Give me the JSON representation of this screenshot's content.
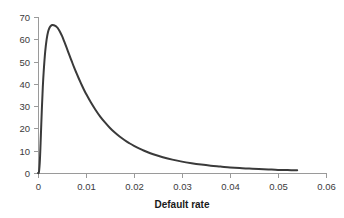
{
  "chart_data": {
    "type": "line",
    "title": "",
    "subtitle": "",
    "xlabel": "Default rate",
    "ylabel": "",
    "xlim": [
      0,
      0.06
    ],
    "ylim": [
      0,
      70
    ],
    "grid": false,
    "legend": null,
    "legend_position": "none",
    "series_color": "#3a3a3a",
    "axis_color": "#9a9a9a",
    "x_ticks": [
      "0",
      "0.01",
      "0.02",
      "0.03",
      "0.04",
      "0.05",
      "0.06"
    ],
    "x_tick_values": [
      0,
      0.01,
      0.02,
      0.03,
      0.04,
      0.05,
      0.06
    ],
    "y_ticks": [
      "0",
      "10",
      "20",
      "30",
      "40",
      "50",
      "60",
      "70"
    ],
    "y_tick_values": [
      0,
      10,
      20,
      30,
      40,
      50,
      60,
      70
    ],
    "series": [
      {
        "name": "density",
        "x": [
          0.0,
          0.0002,
          0.0004,
          0.0006,
          0.0008,
          0.001,
          0.0012,
          0.0015,
          0.0018,
          0.0021,
          0.0024,
          0.0027,
          0.003,
          0.0033,
          0.0036,
          0.0038,
          0.004,
          0.0043,
          0.0046,
          0.005,
          0.0055,
          0.006,
          0.0065,
          0.007,
          0.0075,
          0.008,
          0.0085,
          0.009,
          0.0095,
          0.01,
          0.011,
          0.012,
          0.013,
          0.014,
          0.015,
          0.016,
          0.017,
          0.018,
          0.019,
          0.02,
          0.022,
          0.024,
          0.026,
          0.028,
          0.03,
          0.032,
          0.034,
          0.036,
          0.038,
          0.04,
          0.042,
          0.044,
          0.046,
          0.048,
          0.05,
          0.052,
          0.054
        ],
        "y": [
          0.0,
          0.5,
          6.0,
          17.0,
          28.5,
          38.5,
          46.0,
          54.5,
          60.0,
          63.4,
          65.2,
          66.1,
          66.4,
          66.3,
          66.0,
          65.7,
          65.3,
          64.4,
          63.3,
          61.5,
          58.8,
          56.0,
          53.1,
          50.3,
          47.5,
          44.9,
          42.4,
          40.0,
          37.7,
          35.6,
          31.7,
          28.3,
          25.2,
          22.6,
          20.2,
          18.2,
          16.4,
          14.8,
          13.4,
          12.2,
          10.1,
          8.4,
          7.1,
          6.0,
          5.1,
          4.4,
          3.8,
          3.3,
          2.9,
          2.5,
          2.2,
          2.0,
          1.8,
          1.6,
          1.4,
          1.3,
          1.2
        ]
      }
    ]
  }
}
